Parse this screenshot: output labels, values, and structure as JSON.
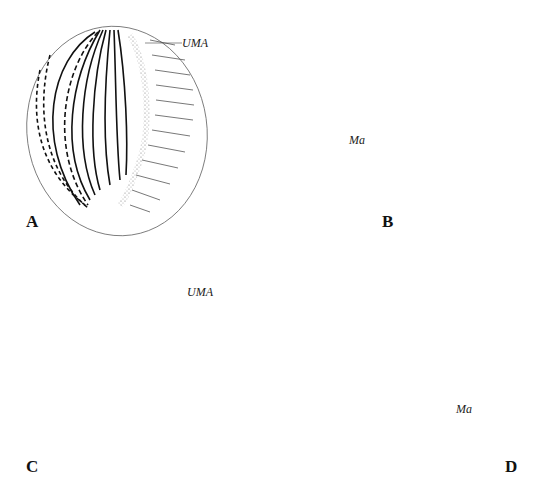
{
  "figure": {
    "panels": [
      {
        "id": "A",
        "label": "A",
        "annotation": "UMA"
      },
      {
        "id": "B",
        "label": "B",
        "annotation": "Ma"
      },
      {
        "id": "C",
        "label": "C",
        "annotation": "UMA"
      },
      {
        "id": "D",
        "label": "D",
        "annotation": "Ma"
      }
    ],
    "colors": {
      "ink": "#1a1a1a",
      "outline": "#555555",
      "stipple": "#9a9a9a",
      "background": "#ffffff"
    }
  }
}
